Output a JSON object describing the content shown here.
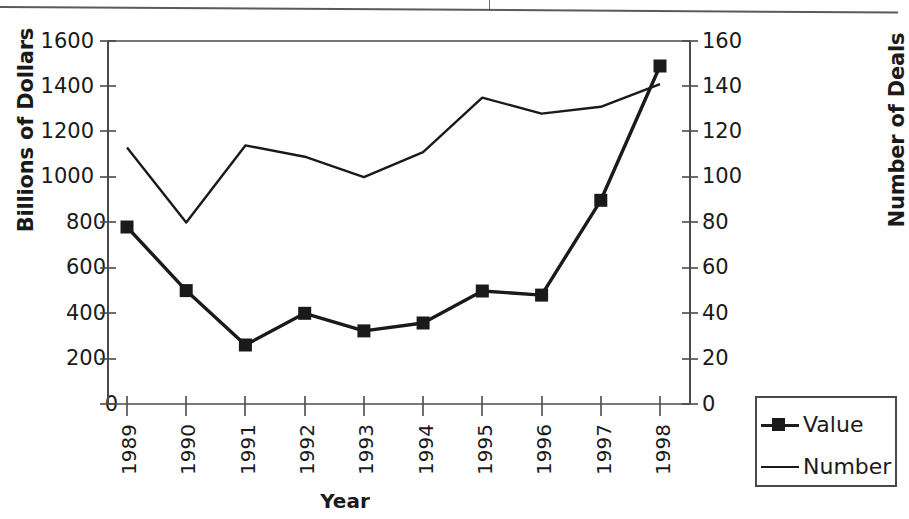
{
  "chart_data": {
    "type": "line",
    "title": "",
    "xlabel": "Year",
    "ylabel": "Billions of Dollars",
    "ylabel_right": "Number of Deals",
    "categories": [
      "1989",
      "1990",
      "1991",
      "1992",
      "1993",
      "1994",
      "1995",
      "1996",
      "1997",
      "1998"
    ],
    "ylim": [
      0,
      1600
    ],
    "ylim_right": [
      0,
      160
    ],
    "yticks": [
      "0",
      "200",
      "400",
      "600",
      "800",
      "1000",
      "1200",
      "1400",
      "1600"
    ],
    "yticks_right": [
      "0",
      "20",
      "40",
      "60",
      "80",
      "100",
      "120",
      "140",
      "160"
    ],
    "grid": false,
    "legend_position": "bottom-right",
    "series": [
      {
        "name": "Value",
        "axis": "left",
        "marker": "filled-square",
        "values": [
          780,
          500,
          260,
          400,
          322,
          357,
          498,
          480,
          898,
          1490
        ]
      },
      {
        "name": "Number",
        "axis": "right",
        "marker": "none",
        "values": [
          113,
          80,
          114,
          109,
          100,
          111,
          135,
          128,
          131,
          141
        ]
      }
    ]
  },
  "axes": {
    "left_title": "Billions of Dollars",
    "right_title": "Number of Deals",
    "bottom_title": "Year"
  },
  "legend": {
    "entries": [
      {
        "label": "Value",
        "symbol": "line-with-square-marker"
      },
      {
        "label": "Number",
        "symbol": "plain-line"
      }
    ]
  },
  "colors": {
    "ink": "#1a1a1a",
    "axis": "#4a4a4a",
    "background": "#ffffff"
  }
}
